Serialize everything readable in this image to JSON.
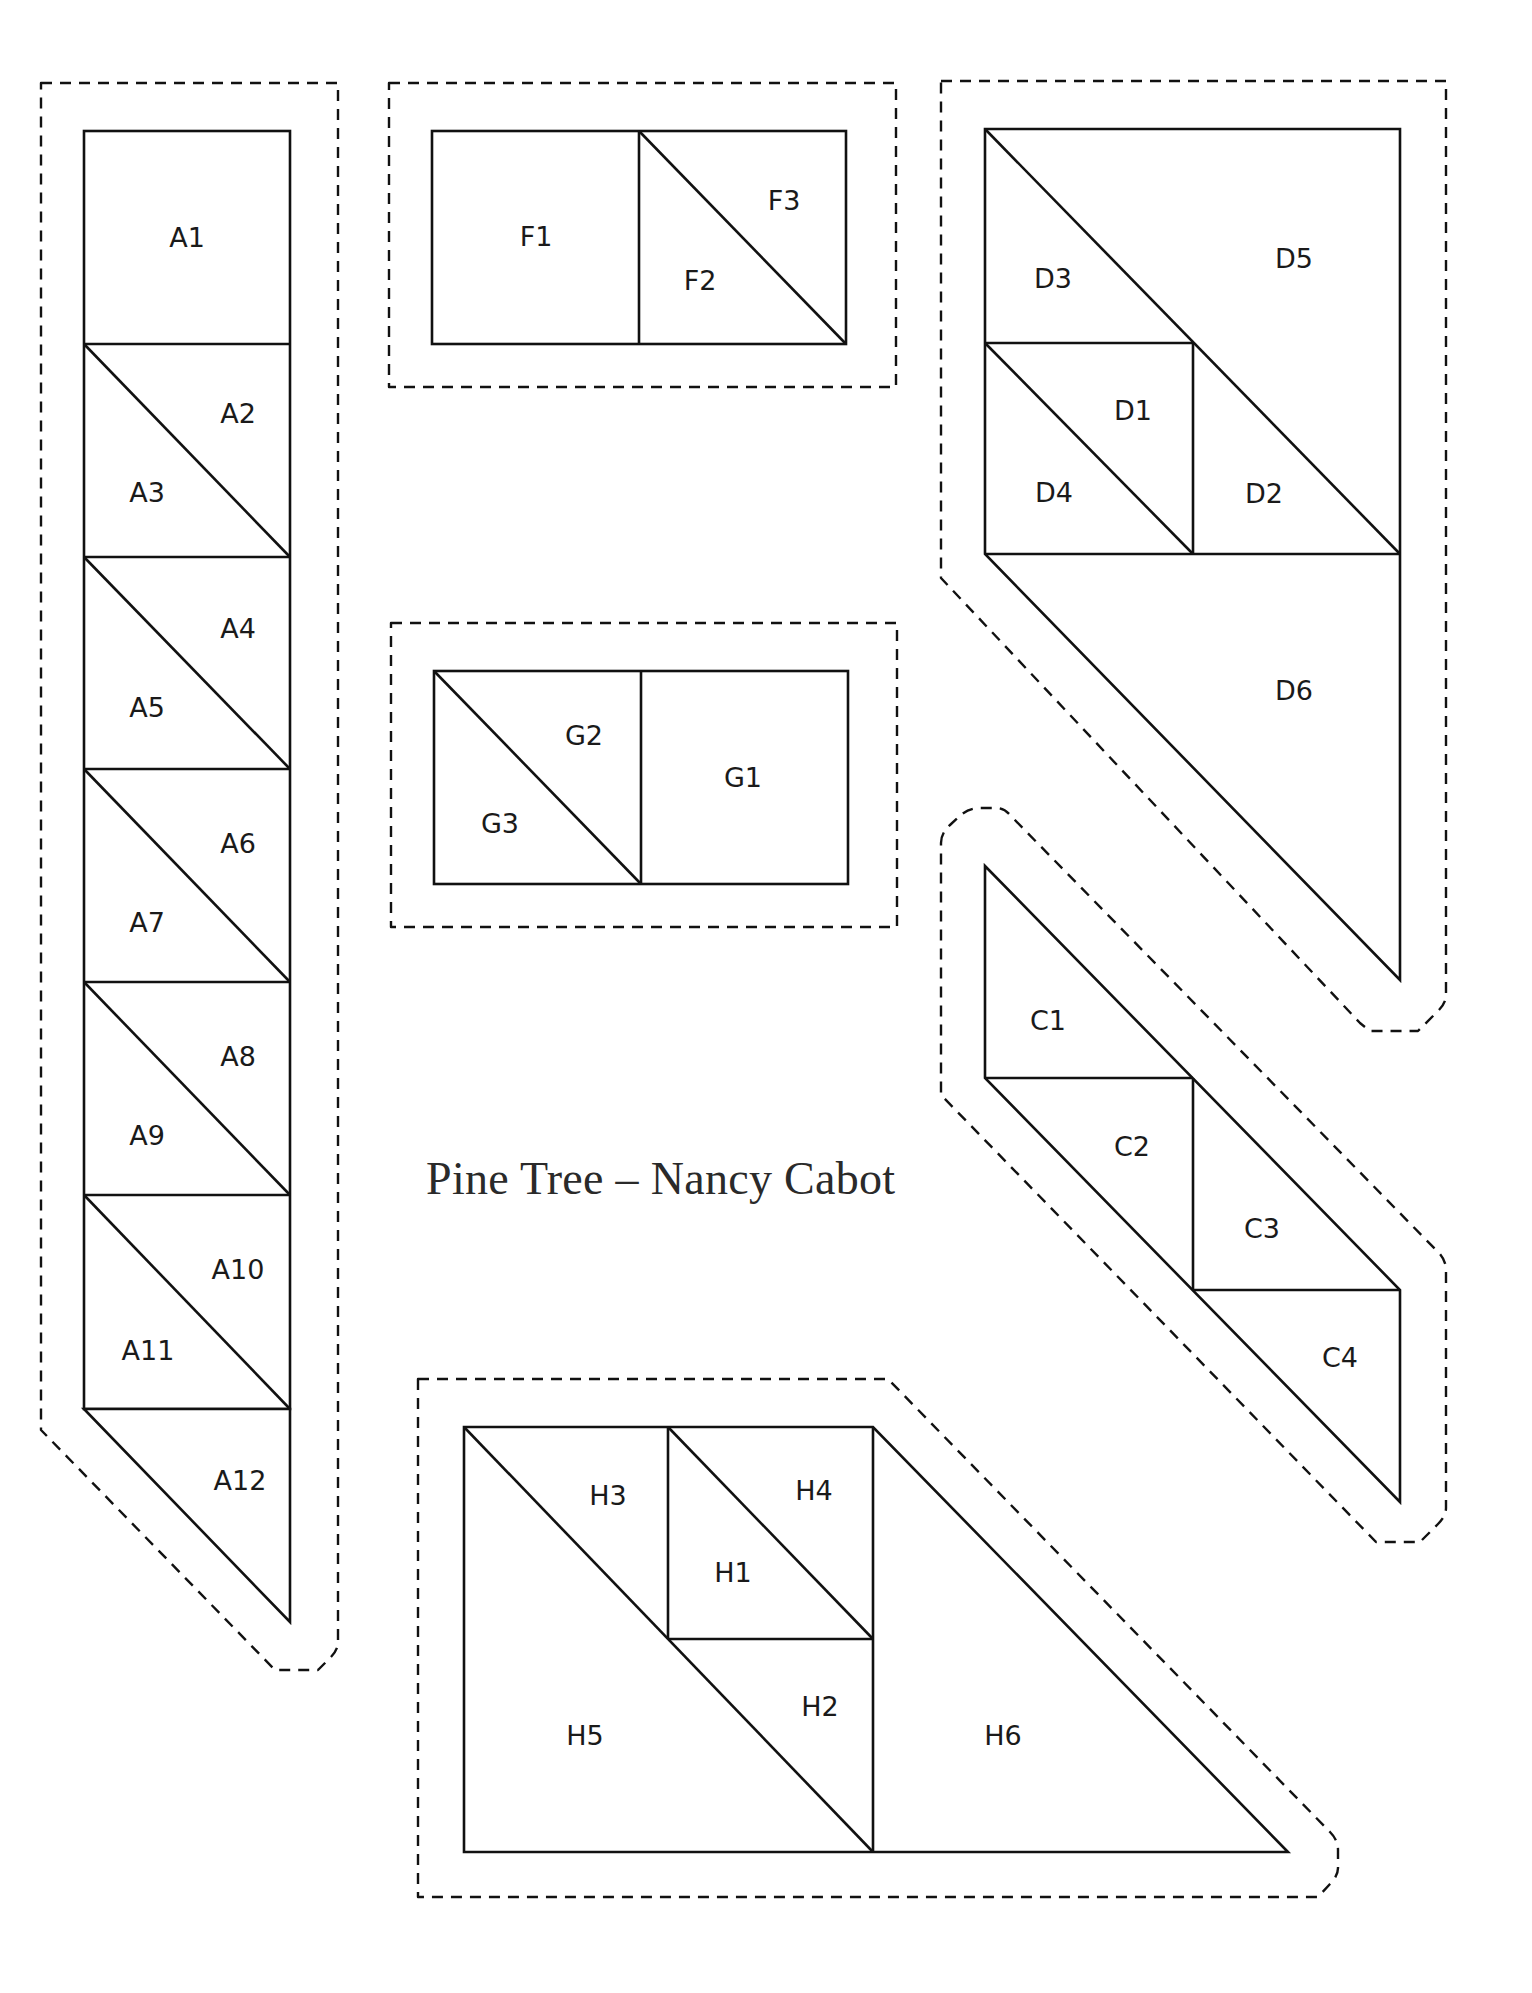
{
  "title": "Pine Tree – Nancy Cabot",
  "colors": {
    "line": "#111111",
    "background": "#ffffff",
    "text": "#1a1a1a"
  },
  "units": {
    "A": {
      "labels": [
        "A1",
        "A2",
        "A3",
        "A4",
        "A5",
        "A6",
        "A7",
        "A8",
        "A9",
        "A10",
        "A11",
        "A12"
      ]
    },
    "F": {
      "labels": [
        "F1",
        "F2",
        "F3"
      ]
    },
    "G": {
      "labels": [
        "G1",
        "G2",
        "G3"
      ]
    },
    "D": {
      "labels": [
        "D1",
        "D2",
        "D3",
        "D4",
        "D5",
        "D6"
      ]
    },
    "C": {
      "labels": [
        "C1",
        "C2",
        "C3",
        "C4"
      ]
    },
    "H": {
      "labels": [
        "H1",
        "H2",
        "H3",
        "H4",
        "H5",
        "H6"
      ]
    }
  }
}
